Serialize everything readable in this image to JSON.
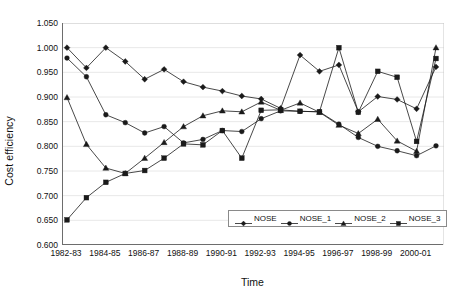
{
  "chart_data": {
    "type": "line",
    "title": "",
    "xlabel": "Time",
    "ylabel": "Cost efficiency",
    "ylim": [
      0.6,
      1.05
    ],
    "ytick_labels": [
      "1.050",
      "1.000",
      "0.950",
      "0.900",
      "0.850",
      "0.800",
      "0.750",
      "0.700",
      "0.650",
      "0.600"
    ],
    "ytick_values": [
      1.05,
      1.0,
      0.95,
      0.9,
      0.85,
      0.8,
      0.75,
      0.7,
      0.65,
      0.6
    ],
    "grid": true,
    "legend_position": "inside-bottom-right",
    "categories": [
      "1982-83",
      "1983-84",
      "1984-85",
      "1985-86",
      "1986-87",
      "1987-88",
      "1988-89",
      "1989-90",
      "1990-91",
      "1991-92",
      "1992-93",
      "1993-94",
      "1994-95",
      "1995-96",
      "1996-97",
      "1997-98",
      "1998-99",
      "1999-00",
      "2000-01",
      "2001-02"
    ],
    "xtick_labels": [
      "1982-83",
      "1984-85",
      "1986-87",
      "1988-89",
      "1990-91",
      "1992-93",
      "1994-95",
      "1996-97",
      "1998-99",
      "2000-01"
    ],
    "xtick_indices": [
      0,
      2,
      4,
      6,
      8,
      10,
      12,
      14,
      16,
      18
    ],
    "series": [
      {
        "name": "NOSE",
        "marker": "diamond",
        "values": [
          1.0,
          0.959,
          1.0,
          0.972,
          0.936,
          0.956,
          0.931,
          0.92,
          0.912,
          0.902,
          0.896,
          0.877,
          0.985,
          0.952,
          0.965,
          0.87,
          0.901,
          0.895,
          0.876,
          0.961
        ]
      },
      {
        "name": "NOSE_1",
        "marker": "circle",
        "values": [
          0.979,
          0.941,
          0.864,
          0.848,
          0.827,
          0.84,
          0.807,
          0.814,
          0.832,
          0.83,
          0.856,
          0.872,
          0.871,
          0.87,
          0.845,
          0.818,
          0.8,
          0.791,
          0.781,
          0.801
        ]
      },
      {
        "name": "NOSE_2",
        "marker": "triangle",
        "values": [
          0.899,
          0.804,
          0.756,
          0.745,
          0.776,
          0.808,
          0.84,
          0.862,
          0.872,
          0.87,
          0.89,
          0.873,
          0.888,
          0.869,
          0.843,
          0.826,
          0.855,
          0.811,
          0.79,
          1.0
        ]
      },
      {
        "name": "NOSE_3",
        "marker": "square",
        "values": [
          0.651,
          0.696,
          0.727,
          0.745,
          0.751,
          0.776,
          0.805,
          0.803,
          0.832,
          0.776,
          0.873,
          0.874,
          0.871,
          0.87,
          1.0,
          0.869,
          0.952,
          0.94,
          0.81,
          0.978
        ]
      }
    ]
  },
  "legend": {
    "entries": [
      {
        "label": "NOSE",
        "marker": "diamond"
      },
      {
        "label": "NOSE_1",
        "marker": "circle"
      },
      {
        "label": "NOSE_2",
        "marker": "triangle"
      },
      {
        "label": "NOSE_3",
        "marker": "square"
      }
    ]
  },
  "colors": {
    "series": "#1a1a1a",
    "grid": "#e8e8e8",
    "axis": "#6d6d6d",
    "background": "#ffffff"
  }
}
